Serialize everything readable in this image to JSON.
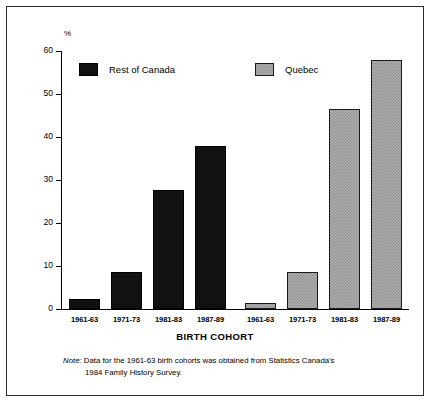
{
  "chart_data": {
    "type": "bar",
    "title": "",
    "xlabel": "BIRTH COHORT",
    "ylabel": "%",
    "ylim": [
      0,
      60
    ],
    "yticks": [
      0,
      10,
      20,
      30,
      40,
      50,
      60
    ],
    "grid": false,
    "legend_position": "top-inside",
    "categories": [
      "1961-63",
      "1971-73",
      "1981-83",
      "1987-89"
    ],
    "series": [
      {
        "name": "Rest of Canada",
        "color": "#111111",
        "values": [
          2.3,
          8.6,
          27.7,
          37.9
        ]
      },
      {
        "name": "Quebec",
        "color": "#b0b0b0",
        "values": [
          1.5,
          8.6,
          46.5,
          58.0
        ]
      }
    ],
    "x_tick_labels": [
      "1961-63",
      "1971-73",
      "1981-83",
      "1987-89",
      "1961-63",
      "1971-73",
      "1981-83",
      "1987-89"
    ],
    "annotations": [
      "Note: Data for the 1961-63 birth cohorts was obtained from Statistics Canada's 1984 Family History Survey."
    ]
  },
  "axis": {
    "y_unit": "%",
    "y_labels": [
      "60",
      "50",
      "40",
      "30",
      "20",
      "10",
      "0"
    ],
    "x_title": "BIRTH COHORT"
  },
  "legend": {
    "rest_label": "Rest of Canada",
    "quebec_label": "Quebec"
  },
  "footnote": {
    "label": "Note:",
    "line1": "Data for the 1961-63 birth cohorts was obtained from Statistics Canada's",
    "line2": "1984 Family History Survey."
  }
}
